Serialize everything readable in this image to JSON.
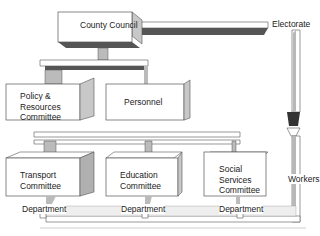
{
  "diagram": {
    "nodes": {
      "county_council": "County Council",
      "policy_resources": [
        "Policy &",
        "Resources",
        "Committee"
      ],
      "personnel": "Personnel",
      "transport": [
        "Transport",
        "Committee"
      ],
      "education": [
        "Education",
        "Committee"
      ],
      "social_services": [
        "Social",
        "Services",
        "Committee"
      ]
    },
    "labels": {
      "electorate": "Electorate",
      "workers": "Workers",
      "department_1": "Department",
      "department_2": "Department",
      "department_3": "Department"
    },
    "colors": {
      "box_fill": "#ffffff",
      "box_stroke": "#555555",
      "shadow_dark": "#555555",
      "shadow_mid": "#b8b8b8",
      "flow_light": "#eeeeee"
    }
  }
}
